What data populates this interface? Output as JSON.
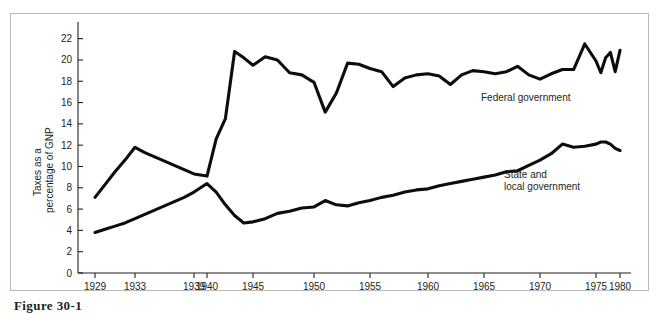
{
  "figure": {
    "caption": "Figure 30-1"
  },
  "chart_data": {
    "type": "line",
    "title": "",
    "xlabel": "",
    "ylabel": "Taxes as a percentage of GNP",
    "ylabel_line1": "Taxes as a",
    "ylabel_line2": "percentage of GNP",
    "xlim": [
      1929,
      1980
    ],
    "ylim": [
      0,
      23
    ],
    "ytick_values": [
      0,
      2,
      4,
      6,
      8,
      10,
      12,
      14,
      16,
      18,
      20,
      22
    ],
    "ytick_labels": [
      "0",
      "2",
      "4",
      "6",
      "8",
      "10",
      "12",
      "14",
      "16",
      "18",
      "20",
      "22"
    ],
    "xtick_values": [
      1929,
      1933,
      1939,
      1940,
      1945,
      1950,
      1955,
      1960,
      1965,
      1970,
      1975,
      1980
    ],
    "xtick_labels": [
      "1929",
      "1933",
      "1939",
      "1940",
      "1945",
      "1950",
      "1955",
      "1960",
      "1965",
      "1970",
      "1975",
      "1980"
    ],
    "grid": false,
    "legend_position": "inline-annotation",
    "line_color": "#0d0d0d",
    "axis_color": "#231f20",
    "series": [
      {
        "name": "Federal government",
        "annotation": "Federal government",
        "annotation_lines": [
          "Federal government"
        ],
        "x": [
          1929,
          1930,
          1931,
          1932,
          1933,
          1934,
          1935,
          1936,
          1937,
          1938,
          1939,
          1940,
          1941,
          1942,
          1943,
          1944,
          1945,
          1946,
          1947,
          1948,
          1949,
          1950,
          1951,
          1952,
          1953,
          1954,
          1955,
          1956,
          1957,
          1958,
          1959,
          1960,
          1961,
          1962,
          1963,
          1964,
          1965,
          1966,
          1967,
          1968,
          1969,
          1970,
          1971,
          1972,
          1973,
          1974,
          1975,
          1976,
          1977,
          1978,
          1979,
          1980
        ],
        "values": [
          7.1,
          8.3,
          9.5,
          10.6,
          11.8,
          11.3,
          10.9,
          10.5,
          10.1,
          9.7,
          9.3,
          9.1,
          12.6,
          14.5,
          20.8,
          20.2,
          19.5,
          20.3,
          20.0,
          18.8,
          18.6,
          17.9,
          15.1,
          16.9,
          19.7,
          19.6,
          19.2,
          18.9,
          17.5,
          18.3,
          18.6,
          18.7,
          18.5,
          17.7,
          18.6,
          19.0,
          18.9,
          18.7,
          18.9,
          19.4,
          18.6,
          18.2,
          18.7,
          19.1,
          19.1,
          21.5,
          19.9,
          18.8,
          20.2,
          20.7,
          18.9,
          20.9
        ]
      },
      {
        "name": "State and local government",
        "annotation": "State and local government",
        "annotation_lines": [
          "State and",
          "local government"
        ],
        "x": [
          1929,
          1930,
          1931,
          1932,
          1933,
          1934,
          1935,
          1936,
          1937,
          1938,
          1939,
          1940,
          1941,
          1942,
          1943,
          1944,
          1945,
          1946,
          1947,
          1948,
          1949,
          1950,
          1951,
          1952,
          1953,
          1954,
          1955,
          1956,
          1957,
          1958,
          1959,
          1960,
          1961,
          1962,
          1963,
          1964,
          1965,
          1966,
          1967,
          1968,
          1969,
          1970,
          1971,
          1972,
          1973,
          1974,
          1975,
          1976,
          1977,
          1978,
          1979,
          1980
        ],
        "values": [
          3.8,
          4.1,
          4.4,
          4.7,
          5.1,
          5.5,
          5.9,
          6.3,
          6.7,
          7.1,
          7.6,
          8.4,
          7.6,
          6.4,
          5.4,
          4.7,
          4.8,
          5.1,
          5.6,
          5.8,
          6.1,
          6.2,
          6.8,
          6.4,
          6.3,
          6.6,
          6.8,
          7.1,
          7.3,
          7.6,
          7.8,
          7.9,
          8.2,
          8.4,
          8.6,
          8.8,
          9.0,
          9.2,
          9.5,
          9.6,
          10.1,
          10.6,
          11.2,
          12.1,
          11.8,
          11.9,
          12.1,
          12.3,
          12.3,
          12.1,
          11.7,
          11.5
        ]
      }
    ]
  }
}
